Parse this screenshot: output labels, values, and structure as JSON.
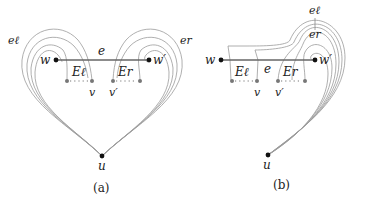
{
  "figure": {
    "panels": [
      {
        "id": "a",
        "caption": "(a)",
        "labels": {
          "w": "w",
          "w_prime": "w′",
          "u": "u",
          "v": "v",
          "v_prime": "v′",
          "e": "e",
          "E_left": "Eℓ",
          "E_right": "Er",
          "e_left": "eℓ",
          "e_right": "er"
        }
      },
      {
        "id": "b",
        "caption": "(b)",
        "labels": {
          "w": "w",
          "w_prime": "w′",
          "u": "u",
          "v": "v",
          "v_prime": "v′",
          "e": "e",
          "E_left": "Eℓ",
          "E_right": "Er",
          "e_left": "eℓ",
          "e_right": "er"
        }
      }
    ],
    "colors": {
      "vertex": "#111111",
      "subvertex": "#777777",
      "edge": "#666666",
      "curve": "#9a9a9a"
    }
  }
}
